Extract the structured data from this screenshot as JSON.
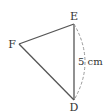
{
  "diagram": {
    "type": "triangle",
    "vertices": [
      {
        "name": "E",
        "x": 74,
        "y": 24,
        "label_x": 74,
        "label_y": 20
      },
      {
        "name": "F",
        "x": 19,
        "y": 44,
        "label_x": 12,
        "label_y": 49
      },
      {
        "name": "D",
        "x": 74,
        "y": 100,
        "label_x": 74,
        "label_y": 112
      }
    ],
    "side_label": "5 cm",
    "side": "ED",
    "colors": {
      "stroke": "#555555",
      "dashed": "#999999",
      "text": "#333333"
    }
  }
}
